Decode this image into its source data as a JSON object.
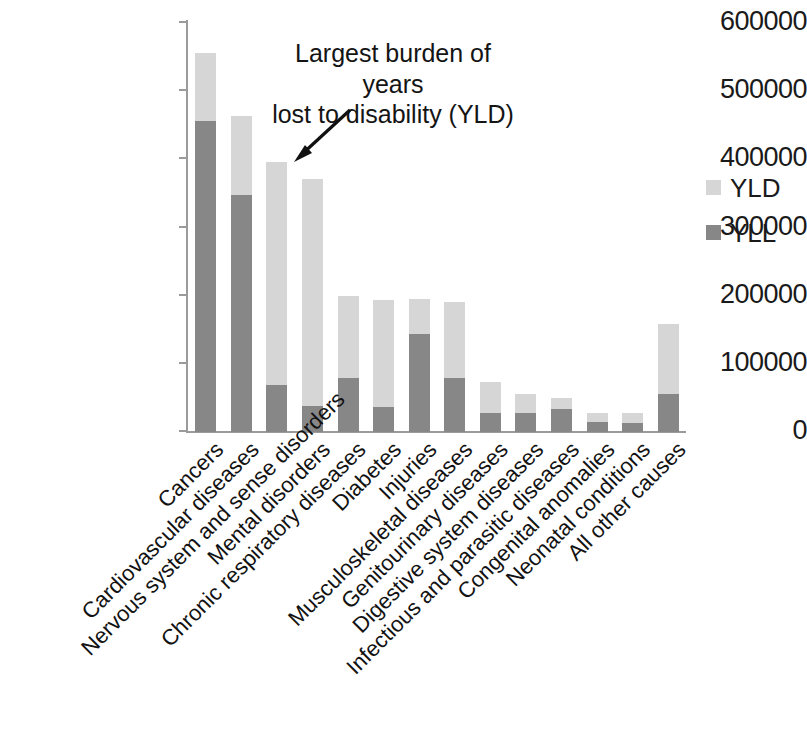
{
  "chart_data": {
    "type": "bar",
    "subtype": "stacked-vertical",
    "title": "",
    "xlabel": "",
    "ylabel": "",
    "ylim": [
      0,
      600000
    ],
    "yticks": [
      0,
      100000,
      200000,
      300000,
      400000,
      500000,
      600000
    ],
    "ytick_labels": [
      "0",
      "100000",
      "200000",
      "300000",
      "400000",
      "500000",
      "600000"
    ],
    "grid": false,
    "legend_position": "right",
    "categories": [
      "Cancers",
      "Cardiovascular diseases",
      "Nervous system and sense disorders",
      "Mental disorders",
      "Chronic respiratory diseases",
      "Diabetes",
      "Injuries",
      "Musculoskeletal diseases",
      "Genitourinary diseases",
      "Digestive system diseases",
      "Infectious and parasitic diseases",
      "Congenital anomalies",
      "Neonatal conditions",
      "All other causes"
    ],
    "series": [
      {
        "name": "YLL",
        "color": "#878787",
        "values": [
          453000,
          345000,
          68000,
          38000,
          78000,
          37000,
          143000,
          78000,
          28000,
          27000,
          33000,
          15000,
          13000,
          55000
        ]
      },
      {
        "name": "YLD",
        "color": "#d6d6d6",
        "values": [
          99000,
          115000,
          325000,
          330000,
          120000,
          155000,
          50000,
          112000,
          45000,
          28000,
          17000,
          12000,
          14000,
          102000
        ]
      }
    ],
    "totals": [
      552000,
      460000,
      393000,
      368000,
      198000,
      192000,
      193000,
      190000,
      73000,
      55000,
      50000,
      27000,
      27000,
      157000
    ],
    "annotations": [
      {
        "text_line1": "Largest burden of years",
        "text_line2": "lost to disability (YLD)",
        "points_to": "Nervous system and sense disorders"
      }
    ]
  },
  "legend": {
    "items": [
      {
        "label": "YLD",
        "color": "#d6d6d6"
      },
      {
        "label": "YLL",
        "color": "#878787"
      }
    ]
  },
  "annotation": {
    "line1": "Largest burden of years",
    "line2": "lost to disability (YLD)"
  },
  "axis": {
    "y_labels": [
      "600000",
      "500000",
      "400000",
      "300000",
      "200000",
      "100000",
      "0"
    ]
  }
}
